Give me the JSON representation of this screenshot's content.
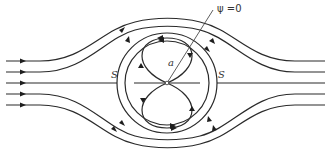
{
  "diagram": {
    "labels": {
      "psi": "ψ =0",
      "radius": "a",
      "stagnation_left": "S",
      "stagnation_right": "S"
    },
    "colors": {
      "stroke": "#2a2a2a",
      "background": "#ffffff"
    },
    "center": [
      167,
      83
    ],
    "stagnation_circle_radius": 50,
    "upstream_line_y": [
      61,
      72,
      83,
      94,
      105
    ],
    "downstream_line_y": [
      61,
      72,
      83,
      94,
      105
    ]
  }
}
